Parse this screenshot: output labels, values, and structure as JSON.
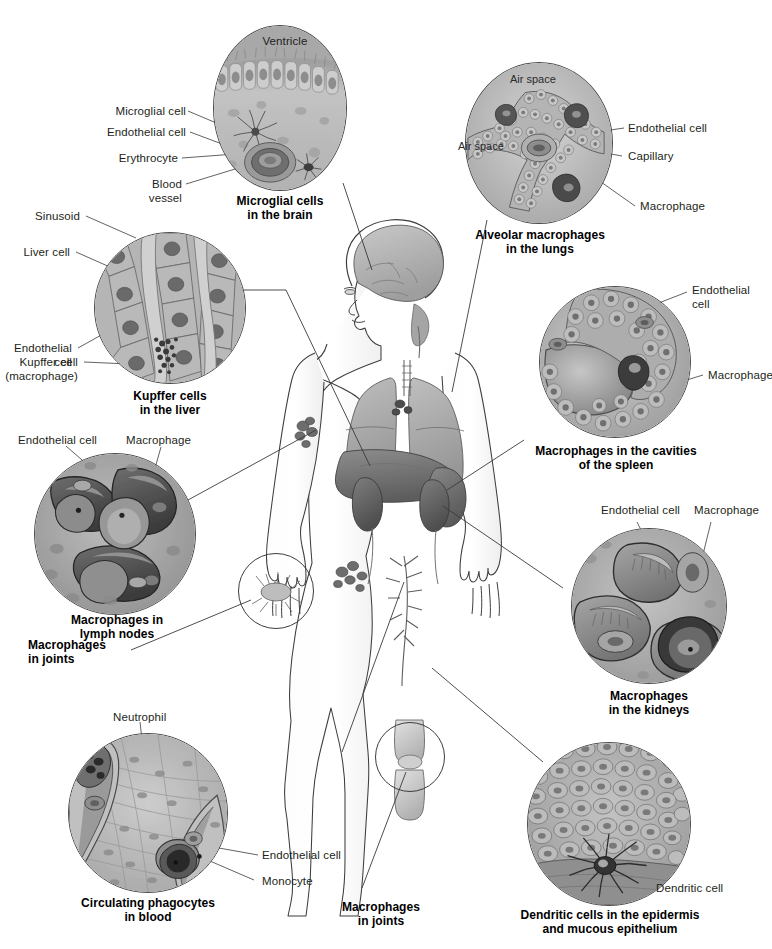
{
  "figure": {
    "background": "#ffffff",
    "ink": "#231f20",
    "line_color": "#4a4a4a"
  },
  "panels": [
    {
      "id": "brain",
      "caption": "Microglial cells\nin the brain",
      "internal_labels": [
        "Ventricle"
      ],
      "callouts": [
        "Microglial cell",
        "Endothelial cell",
        "Erythrocyte",
        "Blood\nvessel"
      ]
    },
    {
      "id": "lungs",
      "caption": "Alveolar macrophages\nin the lungs",
      "internal_labels": [
        "Air space",
        "Air space"
      ],
      "callouts": [
        "Endothelial cell",
        "Capillary",
        "Macrophage"
      ]
    },
    {
      "id": "liver",
      "caption": "Kupffer cells\nin the liver",
      "internal_labels": [],
      "callouts": [
        "Sinusoid",
        "Liver cell",
        "Endothelial\ncell",
        "Kupffer cell\n(macrophage)"
      ]
    },
    {
      "id": "spleen",
      "caption": "Macrophages in the cavities\nof the spleen",
      "internal_labels": [],
      "callouts": [
        "Endothelial\ncell",
        "Macrophage"
      ]
    },
    {
      "id": "lymph",
      "caption": "Macrophages in\nlymph nodes",
      "internal_labels": [],
      "callouts": [
        "Endothelial cell",
        "Macrophage"
      ]
    },
    {
      "id": "kidney",
      "caption": "Macrophages\nin the kidneys",
      "internal_labels": [],
      "callouts": [
        "Endothelial cell",
        "Macrophage"
      ]
    },
    {
      "id": "blood",
      "caption": "Circulating phagocytes\nin blood",
      "internal_labels": [],
      "callouts": [
        "Neutrophil",
        "Endothelial cell",
        "Monocyte"
      ]
    },
    {
      "id": "epidermis",
      "caption": "Dendritic cells in the epidermis\nand mucous epithelium",
      "internal_labels": [],
      "callouts": [
        "Dendritic cell"
      ]
    }
  ],
  "body_callouts": [
    {
      "id": "joints-hand",
      "text": "Macrophages\nin joints"
    },
    {
      "id": "joints-knee",
      "text": "Macrophages\nin joints"
    }
  ],
  "labels": {
    "ventricle": "Ventricle",
    "microglial_cell": "Microglial cell",
    "endothelial_cell": "Endothelial cell",
    "erythrocyte": "Erythrocyte",
    "blood_vessel": "Blood\nvessel",
    "brain_caption": "Microglial cells\nin the brain",
    "air_space_1": "Air space",
    "air_space_2": "Air space",
    "lung_endothelial": "Endothelial cell",
    "capillary": "Capillary",
    "lung_macrophage": "Macrophage",
    "lungs_caption": "Alveolar macrophages\nin the lungs",
    "sinusoid": "Sinusoid",
    "liver_cell": "Liver cell",
    "liver_endothelial": "Endothelial\ncell",
    "kupffer_cell": "Kupffer cell\n(macrophage)",
    "liver_caption": "Kupffer cells\nin the liver",
    "spleen_endothelial": "Endothelial\ncell",
    "spleen_macrophage": "Macrophage",
    "spleen_caption": "Macrophages in the cavities\nof the spleen",
    "lymph_endothelial": "Endothelial cell",
    "lymph_macrophage": "Macrophage",
    "lymph_caption": "Macrophages in\nlymph nodes",
    "joints_hand_caption": "Macrophages\nin joints",
    "kidney_endothelial": "Endothelial cell",
    "kidney_macrophage": "Macrophage",
    "kidney_caption": "Macrophages\nin the kidneys",
    "neutrophil": "Neutrophil",
    "blood_endothelial": "Endothelial cell",
    "monocyte": "Monocyte",
    "blood_caption": "Circulating phagocytes\nin blood",
    "joints_knee_caption": "Macrophages\nin joints",
    "dendritic_cell": "Dendritic cell",
    "epidermis_caption": "Dendritic cells in the epidermis\nand mucous epithelium"
  }
}
